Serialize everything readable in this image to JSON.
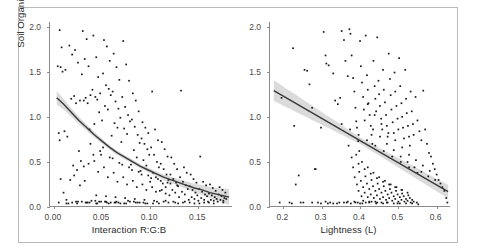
{
  "figure": {
    "y_axis_label": "Soil Organic Carbon (%)",
    "y_ticks": [
      "0.0",
      "0.5",
      "1.0",
      "1.5",
      "2.0"
    ],
    "y_tick_values": [
      0.0,
      0.5,
      1.0,
      1.5,
      2.0
    ],
    "ylim": [
      0.0,
      2.05
    ],
    "point_color": "#1a1a1a",
    "line_color": "#3a3a3a",
    "band_color": "#bdbdbd",
    "border_color": "#b9b9b9"
  },
  "chart_data": [
    {
      "type": "scatter",
      "panel": "left",
      "title": "",
      "xlabel": "Interaction R:G:B",
      "ylabel": "Soil Organic Carbon (%)",
      "xlim": [
        -0.004,
        0.185
      ],
      "ylim": [
        0.0,
        2.05
      ],
      "xticks": [
        0.0,
        0.05,
        0.1,
        0.15
      ],
      "xticklabels": [
        "0.00",
        "0.05",
        "0.10",
        "0.15"
      ],
      "grid": false,
      "legend": "none",
      "fit": {
        "kind": "exponential-decay",
        "label": "smoothed fit with 95% confidence band",
        "points": [
          [
            0.003,
            1.21
          ],
          [
            0.01,
            1.14
          ],
          [
            0.018,
            1.05
          ],
          [
            0.026,
            0.96
          ],
          [
            0.034,
            0.88
          ],
          [
            0.042,
            0.8
          ],
          [
            0.05,
            0.73
          ],
          [
            0.058,
            0.66
          ],
          [
            0.066,
            0.6
          ],
          [
            0.074,
            0.55
          ],
          [
            0.082,
            0.5
          ],
          [
            0.09,
            0.45
          ],
          [
            0.098,
            0.41
          ],
          [
            0.106,
            0.37
          ],
          [
            0.114,
            0.33
          ],
          [
            0.122,
            0.3
          ],
          [
            0.13,
            0.27
          ],
          [
            0.138,
            0.24
          ],
          [
            0.146,
            0.21
          ],
          [
            0.154,
            0.19
          ],
          [
            0.162,
            0.16
          ],
          [
            0.17,
            0.14
          ],
          [
            0.178,
            0.12
          ],
          [
            0.182,
            0.11
          ]
        ],
        "ci_halfwidth": [
          0.075,
          0.06,
          0.048,
          0.04,
          0.034,
          0.03,
          0.027,
          0.025,
          0.024,
          0.023,
          0.023,
          0.024,
          0.025,
          0.027,
          0.03,
          0.033,
          0.037,
          0.042,
          0.048,
          0.055,
          0.063,
          0.072,
          0.082,
          0.088
        ]
      },
      "x": [
        0.006,
        0.008,
        0.004,
        0.012,
        0.007,
        0.009,
        0.011,
        0.005,
        0.014,
        0.006,
        0.016,
        0.022,
        0.019,
        0.025,
        0.021,
        0.018,
        0.027,
        0.023,
        0.02,
        0.024,
        0.03,
        0.034,
        0.032,
        0.036,
        0.029,
        0.038,
        0.033,
        0.031,
        0.035,
        0.037,
        0.041,
        0.044,
        0.046,
        0.04,
        0.048,
        0.043,
        0.045,
        0.047,
        0.042,
        0.049,
        0.052,
        0.055,
        0.058,
        0.051,
        0.054,
        0.057,
        0.059,
        0.053,
        0.056,
        0.05,
        0.062,
        0.065,
        0.068,
        0.061,
        0.064,
        0.067,
        0.069,
        0.063,
        0.066,
        0.06,
        0.072,
        0.075,
        0.078,
        0.071,
        0.074,
        0.077,
        0.079,
        0.073,
        0.076,
        0.07,
        0.082,
        0.085,
        0.088,
        0.081,
        0.084,
        0.087,
        0.089,
        0.083,
        0.086,
        0.08,
        0.092,
        0.095,
        0.098,
        0.091,
        0.094,
        0.097,
        0.099,
        0.093,
        0.096,
        0.09,
        0.102,
        0.105,
        0.108,
        0.101,
        0.104,
        0.107,
        0.109,
        0.103,
        0.106,
        0.1,
        0.112,
        0.115,
        0.118,
        0.111,
        0.114,
        0.117,
        0.119,
        0.113,
        0.116,
        0.11,
        0.122,
        0.125,
        0.128,
        0.121,
        0.124,
        0.127,
        0.129,
        0.123,
        0.126,
        0.12,
        0.132,
        0.135,
        0.138,
        0.131,
        0.134,
        0.137,
        0.139,
        0.133,
        0.136,
        0.13,
        0.142,
        0.145,
        0.148,
        0.141,
        0.144,
        0.147,
        0.149,
        0.143,
        0.146,
        0.14,
        0.152,
        0.155,
        0.158,
        0.151,
        0.154,
        0.157,
        0.159,
        0.153,
        0.156,
        0.15,
        0.162,
        0.165,
        0.168,
        0.161,
        0.164,
        0.167,
        0.169,
        0.163,
        0.166,
        0.16,
        0.172,
        0.175,
        0.178,
        0.171,
        0.174,
        0.177,
        0.179,
        0.173,
        0.176,
        0.17,
        0.005,
        0.015,
        0.025,
        0.035,
        0.045,
        0.055,
        0.065,
        0.075,
        0.085,
        0.095,
        0.013,
        0.023,
        0.033,
        0.043,
        0.053,
        0.063,
        0.073,
        0.083,
        0.093,
        0.103,
        0.017,
        0.027,
        0.037,
        0.047,
        0.057,
        0.067,
        0.077,
        0.087,
        0.097,
        0.107,
        0.028,
        0.039,
        0.049,
        0.059,
        0.069,
        0.079,
        0.089,
        0.109,
        0.119,
        0.129,
        0.026,
        0.036,
        0.046,
        0.056,
        0.066,
        0.076,
        0.086,
        0.096,
        0.106,
        0.116,
        0.031,
        0.041,
        0.051,
        0.061,
        0.071,
        0.081,
        0.091,
        0.101,
        0.111,
        0.121,
        0.044,
        0.054,
        0.064,
        0.074,
        0.084,
        0.094,
        0.104,
        0.114,
        0.124,
        0.134,
        0.038,
        0.048,
        0.058,
        0.068,
        0.078,
        0.088,
        0.098,
        0.108,
        0.118,
        0.128,
        0.021,
        0.032,
        0.042,
        0.052,
        0.062,
        0.072,
        0.082,
        0.092,
        0.102,
        0.112,
        0.146,
        0.156,
        0.166,
        0.176,
        0.136,
        0.126,
        0.116,
        0.141,
        0.151,
        0.161,
        0.007,
        0.01,
        0.013,
        0.019,
        0.024,
        0.029,
        0.034,
        0.044,
        0.054,
        0.064
      ],
      "y": [
        1.96,
        1.77,
        1.56,
        1.52,
        1.55,
        1.5,
        0.84,
        0.82,
        0.78,
        0.74,
        1.79,
        1.74,
        1.69,
        1.6,
        1.23,
        1.2,
        1.18,
        1.15,
        0.46,
        0.41,
        1.95,
        1.86,
        1.64,
        1.56,
        1.47,
        1.24,
        1.21,
        1.18,
        1.15,
        0.86,
        1.9,
        1.66,
        1.44,
        1.3,
        1.26,
        1.22,
        1.19,
        1.05,
        0.92,
        0.58,
        1.85,
        1.78,
        1.62,
        1.48,
        1.35,
        1.31,
        1.24,
        1.12,
        1.08,
        0.96,
        1.7,
        1.55,
        1.41,
        1.28,
        1.17,
        1.09,
        0.99,
        0.93,
        0.88,
        0.79,
        1.84,
        1.58,
        1.4,
        1.22,
        1.11,
        1.02,
        0.95,
        0.87,
        0.81,
        0.72,
        1.26,
        1.18,
        1.06,
        0.97,
        0.89,
        0.8,
        0.71,
        0.63,
        0.55,
        0.47,
        0.94,
        0.88,
        0.82,
        0.76,
        0.7,
        0.64,
        0.58,
        0.52,
        0.46,
        0.4,
        1.28,
        0.86,
        0.74,
        0.66,
        0.58,
        0.5,
        0.44,
        0.38,
        0.33,
        0.28,
        0.72,
        0.64,
        0.56,
        0.48,
        0.42,
        0.36,
        0.3,
        0.26,
        0.22,
        0.18,
        0.55,
        0.48,
        0.42,
        0.36,
        0.31,
        0.27,
        0.23,
        0.19,
        0.16,
        0.13,
        1.29,
        0.44,
        0.38,
        0.33,
        0.28,
        0.24,
        0.2,
        0.17,
        0.14,
        0.11,
        0.36,
        0.31,
        0.27,
        0.23,
        0.19,
        0.16,
        0.13,
        0.11,
        0.09,
        0.08,
        0.56,
        0.28,
        0.24,
        0.2,
        0.17,
        0.14,
        0.12,
        0.1,
        0.08,
        0.07,
        0.25,
        0.21,
        0.18,
        0.15,
        0.13,
        0.11,
        0.09,
        0.08,
        0.07,
        0.06,
        0.22,
        0.19,
        0.16,
        0.14,
        0.12,
        0.1,
        0.09,
        0.08,
        0.07,
        0.06,
        0.05,
        0.04,
        0.06,
        0.05,
        0.04,
        0.05,
        0.06,
        0.04,
        0.05,
        0.04,
        0.08,
        0.06,
        0.05,
        0.07,
        0.06,
        0.05,
        0.04,
        0.06,
        0.05,
        0.04,
        0.3,
        0.24,
        0.05,
        0.06,
        0.04,
        0.05,
        0.07,
        0.05,
        0.04,
        0.06,
        0.51,
        0.07,
        0.06,
        0.05,
        0.04,
        0.06,
        0.05,
        0.04,
        0.05,
        0.04,
        0.62,
        0.48,
        0.39,
        0.33,
        0.28,
        0.25,
        0.22,
        0.19,
        0.17,
        0.15,
        0.45,
        0.58,
        0.66,
        0.54,
        0.47,
        0.41,
        0.36,
        0.32,
        0.29,
        0.26,
        0.13,
        0.12,
        0.11,
        0.1,
        0.09,
        0.08,
        0.07,
        0.06,
        0.06,
        0.05,
        0.7,
        0.62,
        0.55,
        0.49,
        0.44,
        0.39,
        0.35,
        0.31,
        0.27,
        0.24,
        0.35,
        0.29,
        0.51,
        0.44,
        0.38,
        0.33,
        0.29,
        0.25,
        0.22,
        0.19,
        0.04,
        0.05,
        0.04,
        0.05,
        0.06,
        0.05,
        0.07,
        0.05,
        0.04,
        0.05,
        0.31,
        0.16,
        0.04,
        0.05,
        0.04,
        0.06,
        0.05,
        0.04,
        0.06,
        0.05
      ]
    },
    {
      "type": "scatter",
      "panel": "right",
      "title": "",
      "xlabel": "Lightness (L)",
      "ylabel": "Soil Organic Carbon (%)",
      "xlim": [
        0.165,
        0.635
      ],
      "ylim": [
        0.0,
        2.05
      ],
      "xticks": [
        0.2,
        0.3,
        0.4,
        0.5,
        0.6
      ],
      "xticklabels": [
        "0.2",
        "0.3",
        "0.4",
        "0.5",
        "0.6"
      ],
      "grid": false,
      "legend": "none",
      "fit": {
        "kind": "linear",
        "label": "linear fit with 95% confidence band",
        "points": [
          [
            0.175,
            1.29
          ],
          [
            0.63,
            0.17
          ]
        ],
        "slope": -2.46,
        "intercept": 1.72,
        "ci_halfwidth_ends": [
          0.115,
          0.075
        ],
        "ci_halfwidth_min": 0.035
      },
      "x": [
        0.195,
        0.225,
        0.228,
        0.232,
        0.24,
        0.255,
        0.262,
        0.268,
        0.275,
        0.282,
        0.29,
        0.298,
        0.305,
        0.31,
        0.312,
        0.318,
        0.322,
        0.33,
        0.335,
        0.342,
        0.348,
        0.352,
        0.358,
        0.362,
        0.368,
        0.372,
        0.375,
        0.378,
        0.382,
        0.385,
        0.388,
        0.39,
        0.392,
        0.395,
        0.398,
        0.4,
        0.402,
        0.405,
        0.408,
        0.41,
        0.412,
        0.415,
        0.418,
        0.42,
        0.422,
        0.425,
        0.428,
        0.43,
        0.432,
        0.435,
        0.438,
        0.44,
        0.442,
        0.445,
        0.448,
        0.45,
        0.452,
        0.455,
        0.458,
        0.46,
        0.462,
        0.465,
        0.468,
        0.47,
        0.472,
        0.475,
        0.478,
        0.48,
        0.482,
        0.485,
        0.488,
        0.49,
        0.492,
        0.495,
        0.498,
        0.5,
        0.502,
        0.505,
        0.508,
        0.51,
        0.512,
        0.515,
        0.518,
        0.52,
        0.522,
        0.525,
        0.528,
        0.53,
        0.532,
        0.535,
        0.538,
        0.54,
        0.545,
        0.55,
        0.555,
        0.56,
        0.565,
        0.57,
        0.575,
        0.58,
        0.585,
        0.59,
        0.595,
        0.6,
        0.605,
        0.61,
        0.615,
        0.62,
        0.625,
        0.628,
        0.275,
        0.31,
        0.34,
        0.365,
        0.385,
        0.4,
        0.415,
        0.43,
        0.445,
        0.46,
        0.37,
        0.39,
        0.405,
        0.42,
        0.435,
        0.45,
        0.465,
        0.48,
        0.495,
        0.51,
        0.378,
        0.396,
        0.412,
        0.428,
        0.444,
        0.46,
        0.476,
        0.492,
        0.508,
        0.524,
        0.382,
        0.398,
        0.414,
        0.43,
        0.446,
        0.462,
        0.478,
        0.494,
        0.51,
        0.526,
        0.386,
        0.402,
        0.418,
        0.434,
        0.45,
        0.466,
        0.482,
        0.498,
        0.514,
        0.53,
        0.392,
        0.408,
        0.424,
        0.44,
        0.456,
        0.472,
        0.488,
        0.504,
        0.52,
        0.536,
        0.396,
        0.412,
        0.428,
        0.444,
        0.46,
        0.476,
        0.492,
        0.508,
        0.524,
        0.54,
        0.404,
        0.42,
        0.436,
        0.452,
        0.468,
        0.484,
        0.5,
        0.516,
        0.532,
        0.548,
        0.408,
        0.424,
        0.44,
        0.456,
        0.472,
        0.488,
        0.504,
        0.52,
        0.536,
        0.552,
        0.216,
        0.245,
        0.298,
        0.33,
        0.358,
        0.376,
        0.394,
        0.442,
        0.47,
        0.498,
        0.352,
        0.374,
        0.396,
        0.418,
        0.44,
        0.462,
        0.484,
        0.506,
        0.528,
        0.55,
        0.42,
        0.438,
        0.456,
        0.474,
        0.492,
        0.51,
        0.528,
        0.546,
        0.564,
        0.582,
        0.434,
        0.452,
        0.47,
        0.488,
        0.506,
        0.524,
        0.542,
        0.56,
        0.578,
        0.596,
        0.19,
        0.222,
        0.252,
        0.284,
        0.316,
        0.346,
        0.368,
        0.388,
        0.406,
        0.424
      ],
      "y": [
        1.21,
        1.76,
        0.9,
        0.25,
        0.35,
        1.52,
        1.51,
        1.36,
        1.1,
        0.42,
        0.05,
        0.88,
        1.94,
        1.68,
        1.59,
        1.57,
        0.05,
        1.48,
        1.18,
        1.14,
        1.21,
        1.95,
        1.85,
        1.62,
        1.45,
        1.97,
        1.92,
        1.68,
        1.43,
        1.28,
        1.1,
        0.95,
        0.88,
        0.73,
        0.62,
        1.84,
        1.56,
        1.38,
        1.22,
        1.08,
        0.96,
        1.9,
        1.46,
        1.3,
        1.15,
        1.02,
        0.9,
        0.8,
        0.7,
        1.62,
        1.34,
        1.2,
        1.06,
        1.88,
        1.4,
        1.25,
        1.12,
        0.98,
        0.86,
        1.52,
        1.3,
        1.16,
        1.02,
        0.9,
        0.78,
        1.7,
        1.42,
        1.24,
        1.08,
        0.94,
        0.82,
        1.49,
        1.28,
        1.12,
        0.98,
        0.86,
        1.65,
        1.34,
        1.15,
        1.0,
        0.88,
        0.76,
        1.52,
        1.2,
        1.04,
        0.9,
        0.78,
        0.68,
        1.28,
        1.06,
        0.92,
        0.8,
        1.22,
        0.96,
        0.84,
        0.74,
        1.29,
        0.86,
        0.7,
        0.6,
        0.56,
        0.48,
        0.42,
        0.36,
        0.3,
        0.26,
        0.22,
        0.18,
        0.1,
        0.05,
        0.05,
        0.06,
        0.04,
        0.05,
        0.06,
        0.04,
        0.05,
        0.06,
        0.05,
        0.04,
        0.68,
        0.58,
        0.5,
        0.44,
        0.38,
        0.33,
        0.29,
        0.25,
        0.22,
        0.19,
        0.55,
        0.48,
        0.42,
        0.37,
        0.32,
        0.28,
        0.25,
        0.22,
        0.19,
        0.16,
        0.44,
        0.39,
        0.34,
        0.3,
        0.26,
        0.23,
        0.2,
        0.18,
        0.15,
        0.13,
        0.33,
        0.29,
        0.26,
        0.23,
        0.2,
        0.18,
        0.16,
        0.14,
        0.12,
        0.1,
        0.25,
        0.22,
        0.2,
        0.18,
        0.16,
        0.14,
        0.12,
        0.11,
        0.09,
        0.08,
        0.18,
        0.16,
        0.14,
        0.13,
        0.11,
        0.1,
        0.09,
        0.08,
        0.07,
        0.06,
        0.12,
        0.11,
        0.1,
        0.09,
        0.08,
        0.07,
        0.06,
        0.06,
        0.05,
        0.05,
        0.07,
        0.06,
        0.06,
        0.05,
        0.05,
        0.04,
        0.04,
        0.04,
        0.04,
        0.03,
        0.05,
        0.05,
        0.04,
        0.04,
        0.05,
        0.04,
        0.05,
        0.04,
        0.05,
        0.04,
        0.92,
        0.86,
        0.8,
        0.74,
        0.68,
        0.62,
        0.56,
        0.5,
        0.44,
        0.38,
        1.14,
        1.02,
        0.92,
        0.82,
        0.74,
        0.66,
        0.58,
        0.52,
        0.46,
        0.4,
        0.86,
        0.78,
        0.7,
        0.63,
        0.56,
        0.5,
        0.44,
        0.39,
        0.34,
        0.3,
        0.05,
        0.04,
        0.05,
        0.42,
        0.04,
        0.05,
        0.06,
        0.05,
        0.04,
        0.05
      ]
    }
  ]
}
